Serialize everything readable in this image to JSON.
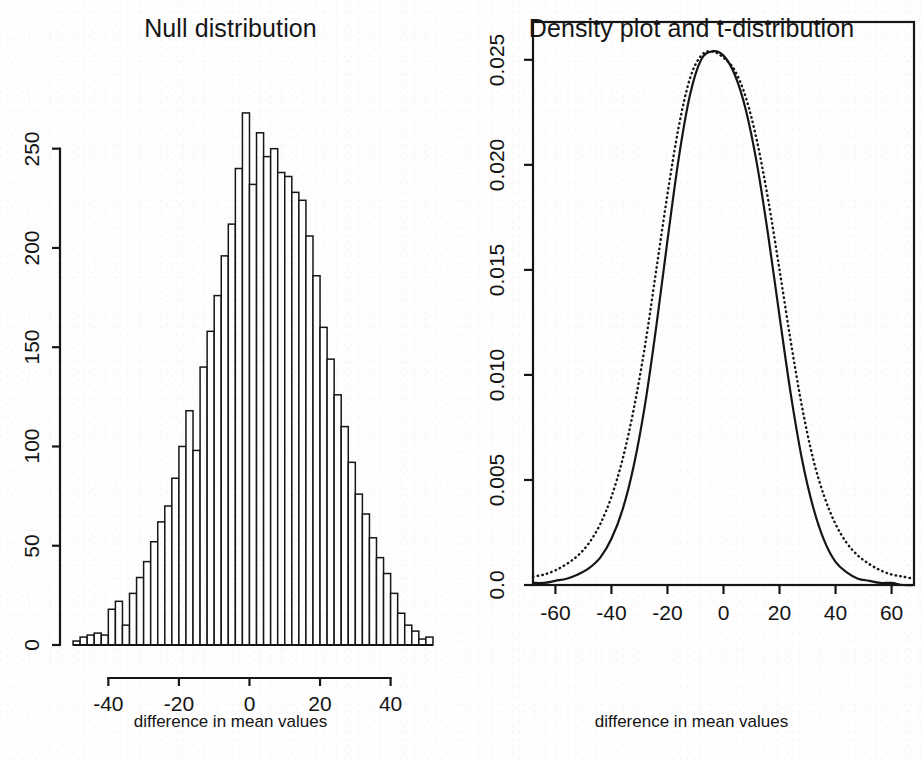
{
  "figure": {
    "background": "#fefefe",
    "ink_color": "#161616",
    "panels": 2
  },
  "panel_left": {
    "title": "Null distribution",
    "xlabel": "difference in mean values",
    "ylabel": "",
    "xticks": [
      "-40",
      "-20",
      "0",
      "20",
      "40"
    ],
    "yticks": [
      "0",
      "50",
      "100",
      "150",
      "200",
      "250"
    ]
  },
  "panel_right": {
    "title": "Density plot and t-distribution",
    "xlabel": "difference in mean values",
    "ylabel": "",
    "xticks": [
      "-60",
      "-40",
      "-20",
      "0",
      "20",
      "40",
      "60"
    ],
    "yticks": [
      "0.0",
      "0.005",
      "0.010",
      "0.015",
      "0.020",
      "0.025"
    ]
  },
  "chart_data": [
    {
      "type": "bar",
      "title": "Null distribution",
      "xlabel": "difference in mean values",
      "ylabel": "",
      "xlim": [
        -52,
        54
      ],
      "ylim": [
        0,
        272
      ],
      "grid": false,
      "legend": "none",
      "bin_width": 2,
      "bin_centers": [
        -49,
        -47,
        -45,
        -43,
        -41,
        -39,
        -37,
        -35,
        -33,
        -31,
        -29,
        -27,
        -25,
        -23,
        -21,
        -19,
        -17,
        -15,
        -13,
        -11,
        -9,
        -7,
        -5,
        -3,
        -1,
        1,
        3,
        5,
        7,
        9,
        11,
        13,
        15,
        17,
        19,
        21,
        23,
        25,
        27,
        29,
        31,
        33,
        35,
        37,
        39,
        41,
        43,
        45,
        47,
        49,
        51
      ],
      "values": [
        2,
        4,
        5,
        6,
        5,
        18,
        22,
        10,
        26,
        34,
        42,
        52,
        62,
        70,
        84,
        100,
        118,
        98,
        140,
        158,
        176,
        196,
        212,
        240,
        268,
        232,
        258,
        246,
        250,
        238,
        236,
        228,
        224,
        206,
        186,
        160,
        144,
        126,
        110,
        92,
        76,
        66,
        54,
        44,
        36,
        26,
        16,
        10,
        7,
        3,
        4
      ],
      "notes": "Simulated permutation null distribution; unimodal, roughly symmetric, centered near 0, peak count about 268"
    },
    {
      "type": "line",
      "title": "Density plot and t-distribution",
      "xlabel": "difference in mean values",
      "ylabel": "",
      "xlim": [
        -68,
        68
      ],
      "ylim": [
        0,
        0.0268
      ],
      "grid": false,
      "legend": "none",
      "x": [
        -68,
        -64,
        -60,
        -56,
        -52,
        -48,
        -44,
        -40,
        -36,
        -32,
        -28,
        -24,
        -20,
        -16,
        -12,
        -8,
        -4,
        0,
        4,
        8,
        12,
        16,
        20,
        24,
        28,
        32,
        36,
        40,
        44,
        48,
        52,
        56,
        60,
        64,
        68
      ],
      "series": [
        {
          "name": "density estimate",
          "style": "solid",
          "values": [
            0.0001,
            0.0001,
            0.0002,
            0.0003,
            0.0005,
            0.0008,
            0.0013,
            0.0022,
            0.0036,
            0.0057,
            0.0086,
            0.0123,
            0.0164,
            0.0203,
            0.0233,
            0.025,
            0.0254,
            0.0252,
            0.0243,
            0.0226,
            0.02,
            0.0166,
            0.0128,
            0.0091,
            0.006,
            0.0037,
            0.0021,
            0.0011,
            0.0006,
            0.0003,
            0.0002,
            0.0001,
            0.0001,
            0.0,
            0.0
          ]
        },
        {
          "name": "t-distribution",
          "style": "dotted",
          "values": [
            0.0004,
            0.0005,
            0.0007,
            0.001,
            0.0014,
            0.002,
            0.0029,
            0.0042,
            0.006,
            0.0084,
            0.0114,
            0.015,
            0.0186,
            0.0218,
            0.0241,
            0.0252,
            0.0254,
            0.0251,
            0.0245,
            0.0232,
            0.0211,
            0.0183,
            0.015,
            0.0116,
            0.0085,
            0.006,
            0.0042,
            0.0029,
            0.002,
            0.0014,
            0.001,
            0.0007,
            0.0005,
            0.0004,
            0.0003
          ]
        }
      ],
      "notes": "Solid kernel density curve overlaid with dotted t-distribution; t-distribution has heavier tails, both peak near 0.0253"
    }
  ]
}
